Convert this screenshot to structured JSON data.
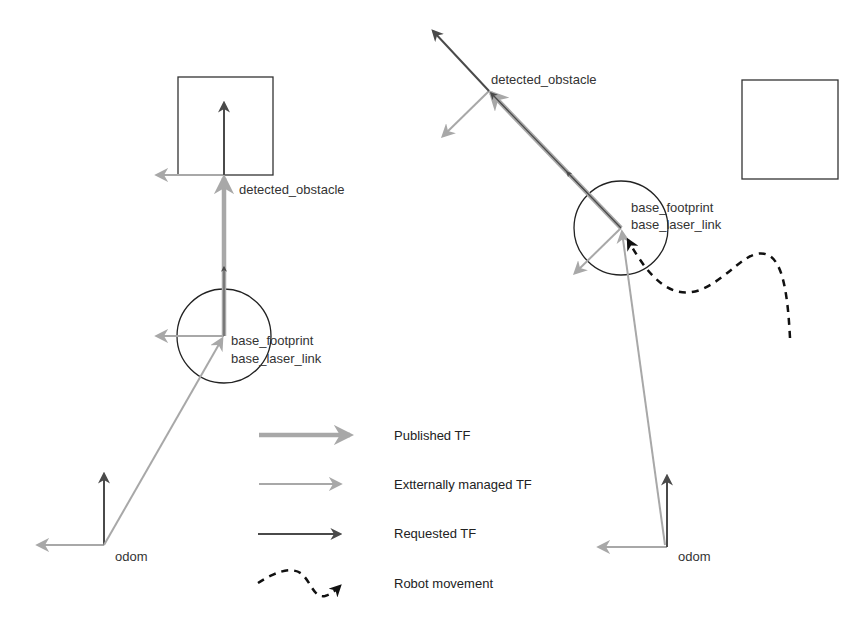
{
  "colors": {
    "published": "#a8a8a8",
    "external": "#a8a8a8",
    "requested": "#4a4a4a",
    "movement": "#111111",
    "outline": "#333333"
  },
  "left_scene": {
    "obstacle_label": "detected_obstacle",
    "base_label_1": "base_footprint",
    "base_label_2": "base_laser_link",
    "odom_label": "odom"
  },
  "right_scene": {
    "obstacle_label": "detected_obstacle",
    "base_label_1": "base_footprint",
    "base_label_2": "base_laser_link",
    "odom_label": "odom"
  },
  "legend": {
    "items": [
      {
        "label": "Published TF",
        "style": "published"
      },
      {
        "label": "Extternally managed TF",
        "style": "external"
      },
      {
        "label": "Requested TF",
        "style": "requested"
      },
      {
        "label": "Robot movement",
        "style": "movement"
      }
    ]
  }
}
